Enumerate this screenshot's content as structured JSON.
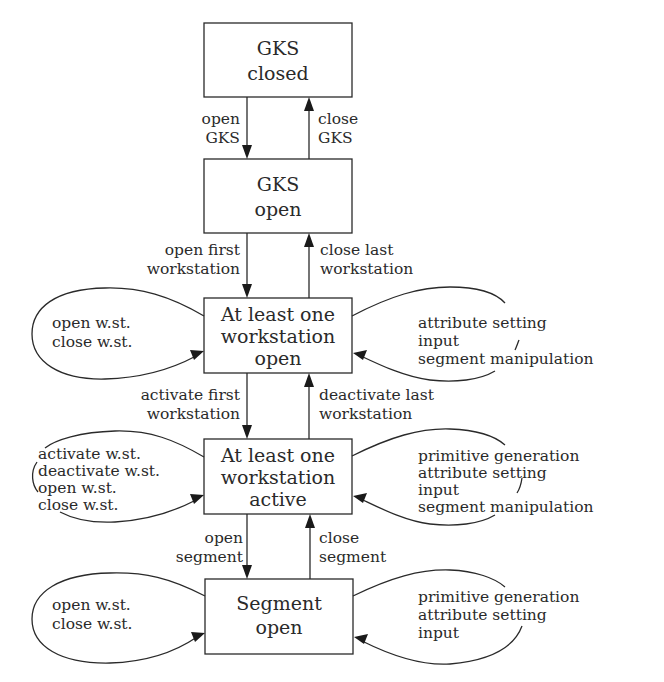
{
  "diagram": {
    "type": "state-transition",
    "states": [
      {
        "id": "gks-closed",
        "lines": [
          "GKS",
          "closed"
        ]
      },
      {
        "id": "gks-open",
        "lines": [
          "GKS",
          "open"
        ]
      },
      {
        "id": "ws-open",
        "lines": [
          "At least one",
          "workstation",
          "open"
        ]
      },
      {
        "id": "ws-active",
        "lines": [
          "At least one",
          "workstation",
          "active"
        ]
      },
      {
        "id": "segment-open",
        "lines": [
          "Segment",
          "open"
        ]
      }
    ],
    "transitions": [
      {
        "from": "gks-closed",
        "to": "gks-open",
        "lines": [
          "open",
          "GKS"
        ]
      },
      {
        "from": "gks-open",
        "to": "gks-closed",
        "lines": [
          "close",
          "GKS"
        ]
      },
      {
        "from": "gks-open",
        "to": "ws-open",
        "lines": [
          "open first",
          "workstation"
        ]
      },
      {
        "from": "ws-open",
        "to": "gks-open",
        "lines": [
          "close last",
          "workstation"
        ]
      },
      {
        "from": "ws-open",
        "to": "ws-active",
        "lines": [
          "activate first",
          "workstation"
        ]
      },
      {
        "from": "ws-active",
        "to": "ws-open",
        "lines": [
          "deactivate last",
          "workstation"
        ]
      },
      {
        "from": "ws-active",
        "to": "segment-open",
        "lines": [
          "open",
          "segment"
        ]
      },
      {
        "from": "segment-open",
        "to": "ws-active",
        "lines": [
          "close",
          "segment"
        ]
      }
    ],
    "loops": {
      "ws_open_left": [
        "open w.st.",
        "close w.st."
      ],
      "ws_open_right": [
        "attribute setting",
        "input",
        "segment manipulation"
      ],
      "ws_active_left": [
        "activate w.st.",
        "deactivate w.st.",
        "open w.st.",
        "close w.st."
      ],
      "ws_active_right": [
        "primitive generation",
        "attribute setting",
        "input",
        "segment manipulation"
      ],
      "seg_open_left": [
        "open w.st.",
        "close w.st."
      ],
      "seg_open_right": [
        "primitive generation",
        "attribute setting",
        "input"
      ]
    }
  }
}
